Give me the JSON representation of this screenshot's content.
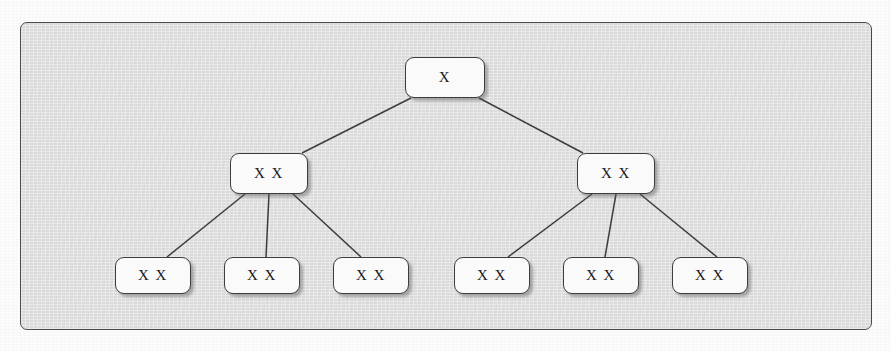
{
  "figure": {
    "type": "tree-diagram",
    "panel": {
      "border_color": "#4a4a4a",
      "background_color": "#e1e1e1"
    },
    "node_style": {
      "fill_color": "#fafafa",
      "border_color": "#3d3d3d",
      "shadow_color": "#5a5a5a",
      "text_color": "#1b1b1b"
    },
    "edge_color": "#3d3d3d"
  },
  "tree": {
    "levels": 3,
    "root": {
      "id": "root",
      "label": "X",
      "x": 384,
      "y": 34,
      "w": 80,
      "h": 41
    },
    "level2": [
      {
        "id": "mid-left",
        "label": "X X",
        "x": 209,
        "y": 130,
        "w": 78,
        "h": 41
      },
      {
        "id": "mid-right",
        "label": "X X",
        "x": 556,
        "y": 130,
        "w": 78,
        "h": 41
      }
    ],
    "leaves": [
      {
        "id": "leaf-1",
        "label": "X X",
        "x": 94,
        "y": 234,
        "w": 76,
        "h": 37
      },
      {
        "id": "leaf-2",
        "label": "X X",
        "x": 203,
        "y": 234,
        "w": 76,
        "h": 37
      },
      {
        "id": "leaf-3",
        "label": "X X",
        "x": 312,
        "y": 234,
        "w": 76,
        "h": 37
      },
      {
        "id": "leaf-4",
        "label": "X X",
        "x": 433,
        "y": 234,
        "w": 76,
        "h": 37
      },
      {
        "id": "leaf-5",
        "label": "X X",
        "x": 542,
        "y": 234,
        "w": 76,
        "h": 37
      },
      {
        "id": "leaf-6",
        "label": "X X",
        "x": 651,
        "y": 234,
        "w": 76,
        "h": 37
      }
    ],
    "edges": [
      {
        "id": "edge-root-mid-left",
        "from": "root",
        "to": "mid-left",
        "x1": 390,
        "y1": 75,
        "x2": 281,
        "y2": 130
      },
      {
        "id": "edge-root-mid-right",
        "from": "root",
        "to": "mid-right",
        "x1": 458,
        "y1": 75,
        "x2": 562,
        "y2": 130
      },
      {
        "id": "edge-midleft-leaf1",
        "from": "mid-left",
        "to": "leaf-1",
        "x1": 224,
        "y1": 171,
        "x2": 146,
        "y2": 234
      },
      {
        "id": "edge-midleft-leaf2",
        "from": "mid-left",
        "to": "leaf-2",
        "x1": 248,
        "y1": 171,
        "x2": 245,
        "y2": 234
      },
      {
        "id": "edge-midleft-leaf3",
        "from": "mid-left",
        "to": "leaf-3",
        "x1": 272,
        "y1": 171,
        "x2": 340,
        "y2": 234
      },
      {
        "id": "edge-midright-leaf4",
        "from": "mid-right",
        "to": "leaf-4",
        "x1": 571,
        "y1": 171,
        "x2": 487,
        "y2": 234
      },
      {
        "id": "edge-midright-leaf5",
        "from": "mid-right",
        "to": "leaf-5",
        "x1": 595,
        "y1": 171,
        "x2": 584,
        "y2": 234
      },
      {
        "id": "edge-midright-leaf6",
        "from": "mid-right",
        "to": "leaf-6",
        "x1": 619,
        "y1": 171,
        "x2": 696,
        "y2": 234
      }
    ]
  }
}
